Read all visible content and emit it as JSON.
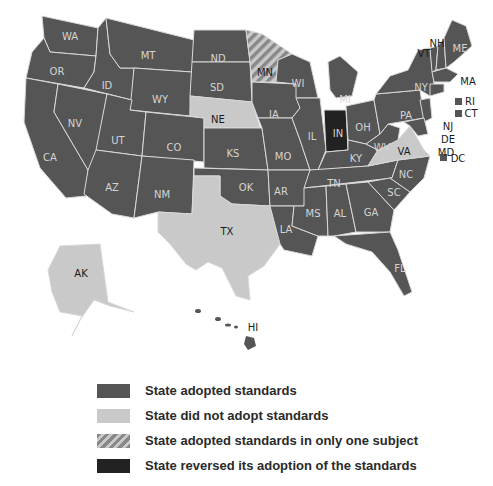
{
  "colors": {
    "adopted": "#555555",
    "not_adopted": "#c9c9c9",
    "one_subject_stripe_a": "#888888",
    "one_subject_stripe_b": "#c9c9c9",
    "reversed": "#222222",
    "border": "#d8d8d8"
  },
  "map": {
    "states": {
      "WA": "WA",
      "OR": "OR",
      "CA": "CA",
      "ID": "ID",
      "NV": "NV",
      "MT": "MT",
      "WY": "WY",
      "UT": "UT",
      "AZ": "AZ",
      "CO": "CO",
      "NM": "NM",
      "ND": "ND",
      "SD": "SD",
      "NE": "NE",
      "KS": "KS",
      "OK": "OK",
      "TX": "TX",
      "MN": "MN",
      "IA": "IA",
      "MO": "MO",
      "AR": "AR",
      "LA": "LA",
      "WI": "WI",
      "IL": "IL",
      "MI": "MI",
      "IN": "IN",
      "OH": "OH",
      "KY": "KY",
      "TN": "TN",
      "MS": "MS",
      "AL": "AL",
      "GA": "GA",
      "FL": "FL",
      "SC": "SC",
      "NC": "NC",
      "VA": "VA",
      "WV": "WV",
      "PA": "PA",
      "NY": "NY",
      "VT": "VT",
      "NH": "NH",
      "ME": "ME",
      "MA": "MA",
      "RI": "RI",
      "CT": "CT",
      "NJ": "NJ",
      "DE": "DE",
      "MD": "MD",
      "DC": "DC",
      "AK": "AK",
      "HI": "HI"
    },
    "status": {
      "adopted": [
        "WA",
        "OR",
        "CA",
        "ID",
        "NV",
        "MT",
        "WY",
        "UT",
        "AZ",
        "CO",
        "NM",
        "ND",
        "SD",
        "KS",
        "OK",
        "IA",
        "MO",
        "AR",
        "LA",
        "WI",
        "IL",
        "MI",
        "OH",
        "KY",
        "TN",
        "MS",
        "AL",
        "GA",
        "FL",
        "SC",
        "NC",
        "WV",
        "PA",
        "NY",
        "VT",
        "NH",
        "ME",
        "MA",
        "RI",
        "CT",
        "NJ",
        "DE",
        "MD",
        "DC",
        "HI"
      ],
      "not_adopted": [
        "NE",
        "TX",
        "VA",
        "AK"
      ],
      "one_subject": [
        "MN"
      ],
      "reversed": [
        "IN"
      ]
    }
  },
  "legend": {
    "items": [
      {
        "label": "State adopted standards"
      },
      {
        "label": "State did not adopt standards"
      },
      {
        "label": "State adopted standards in only one subject"
      },
      {
        "label": "State reversed its adoption of the standards"
      }
    ]
  }
}
